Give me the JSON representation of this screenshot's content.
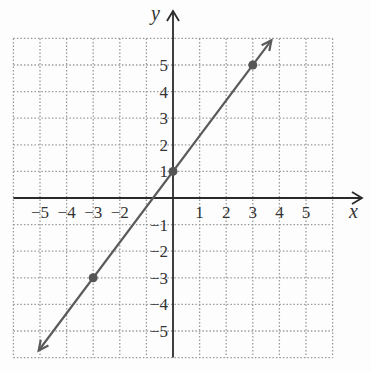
{
  "chart_data": {
    "type": "line",
    "title": "",
    "xlabel": "x",
    "ylabel": "y",
    "xlim": [
      -6,
      6
    ],
    "ylim": [
      -6,
      6
    ],
    "grid": true,
    "x_tick_labels": [
      "-5",
      "-4",
      "-3",
      "-2",
      "1",
      "2",
      "3",
      "4",
      "5"
    ],
    "y_tick_labels": [
      "5",
      "4",
      "3",
      "2",
      "1",
      "-1",
      "-2",
      "-3",
      "-4",
      "-5"
    ],
    "series": [
      {
        "name": "line",
        "equation": "y = 4/3 x + 1",
        "slope": 1.3333,
        "intercept": 1,
        "points": [
          {
            "x": -3,
            "y": -3
          },
          {
            "x": 0,
            "y": 1
          },
          {
            "x": 3,
            "y": 5
          }
        ],
        "arrows_both_ends": true,
        "color": "#555555"
      }
    ]
  },
  "labels": {
    "x_axis": "x",
    "y_axis": "y"
  },
  "colors": {
    "axis": "#2a2a2a",
    "grid": "#9a9a9a",
    "line": "#5a5a5a",
    "point": "#555555",
    "background": "#fdfdfd"
  }
}
